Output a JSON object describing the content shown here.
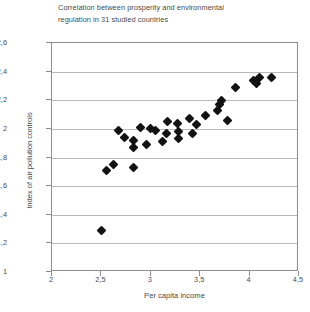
{
  "chart_data": {
    "type": "scatter",
    "title": "Correlation between prosperity and environmental regulation in 31 studied countries",
    "title_line1": "Correlation between prosperity and environmental",
    "title_line2": "regulation in 31 studied countries",
    "xlabel": "Per capita income",
    "ylabel": "Index of air pollution controls",
    "xlim": [
      2,
      4.5
    ],
    "ylim": [
      1,
      2.6
    ],
    "grid": true,
    "legend": "none",
    "xticks": [
      2,
      2.5,
      3,
      3.5,
      4,
      4.5
    ],
    "xtick_labels": [
      "2",
      "2,5",
      "3",
      "3,5",
      "4",
      "4,5"
    ],
    "yticks": [
      1,
      1.2,
      1.4,
      1.6,
      1.8,
      2,
      2.2,
      2.4,
      2.6
    ],
    "ytick_labels": [
      "1",
      "1,2",
      "1,4",
      "1,6",
      "1,8",
      "2",
      "2,2",
      "2,4",
      "2,6"
    ],
    "marker": "diamond",
    "marker_color": "#121212",
    "n_points": 31,
    "points": [
      {
        "x": 2.5,
        "y": 1.29
      },
      {
        "x": 2.55,
        "y": 1.71
      },
      {
        "x": 2.62,
        "y": 1.75
      },
      {
        "x": 2.82,
        "y": 1.73
      },
      {
        "x": 2.67,
        "y": 1.99
      },
      {
        "x": 2.73,
        "y": 1.94
      },
      {
        "x": 2.82,
        "y": 1.92
      },
      {
        "x": 2.82,
        "y": 1.87
      },
      {
        "x": 2.9,
        "y": 2.01
      },
      {
        "x": 3.0,
        "y": 2.0
      },
      {
        "x": 3.05,
        "y": 1.99
      },
      {
        "x": 3.16,
        "y": 1.97
      },
      {
        "x": 3.28,
        "y": 1.98
      },
      {
        "x": 3.28,
        "y": 1.93
      },
      {
        "x": 3.27,
        "y": 2.04
      },
      {
        "x": 3.39,
        "y": 2.07
      },
      {
        "x": 3.42,
        "y": 1.97
      },
      {
        "x": 3.46,
        "y": 2.03
      },
      {
        "x": 3.55,
        "y": 2.09
      },
      {
        "x": 3.68,
        "y": 2.13
      },
      {
        "x": 3.7,
        "y": 2.17
      },
      {
        "x": 3.72,
        "y": 2.2
      },
      {
        "x": 3.78,
        "y": 2.06
      },
      {
        "x": 3.86,
        "y": 2.29
      },
      {
        "x": 4.04,
        "y": 2.34
      },
      {
        "x": 4.07,
        "y": 2.32
      },
      {
        "x": 4.1,
        "y": 2.36
      },
      {
        "x": 4.22,
        "y": 2.36
      },
      {
        "x": 3.17,
        "y": 2.05
      },
      {
        "x": 3.12,
        "y": 1.91
      },
      {
        "x": 2.96,
        "y": 1.89
      }
    ]
  }
}
